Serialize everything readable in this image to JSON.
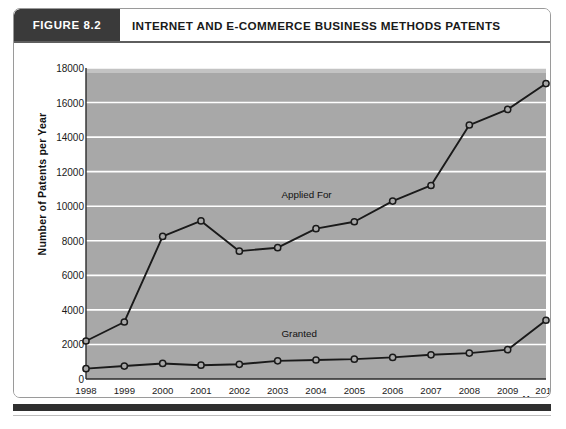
{
  "figure": {
    "badge": "FIGURE 8.2",
    "title": "INTERNET AND E-COMMERCE BUSINESS METHODS PATENTS"
  },
  "chart_data": {
    "type": "line",
    "title": "INTERNET AND E-COMMERCE BUSINESS METHODS PATENTS",
    "xlabel": "Year",
    "ylabel": "Number of Patents per Year",
    "categories": [
      "1998",
      "1999",
      "2000",
      "2001",
      "2002",
      "2003",
      "2004",
      "2005",
      "2006",
      "2007",
      "2008",
      "2009",
      "2010"
    ],
    "xlim": [
      1998,
      2010
    ],
    "ylim": [
      0,
      18000
    ],
    "yticks": [
      0,
      2000,
      4000,
      6000,
      8000,
      10000,
      12000,
      14000,
      16000,
      18000
    ],
    "grid": "horizontal",
    "legend": "inline-annotations",
    "series": [
      {
        "name": "Applied For",
        "values": [
          2200,
          3300,
          8250,
          9150,
          7400,
          7600,
          8700,
          9100,
          10300,
          11200,
          14700,
          15600,
          17100
        ],
        "label_x": 2003.1,
        "label_y": 10600,
        "marker": "open-circle",
        "color": "#1a1a1a"
      },
      {
        "name": "Granted",
        "values": [
          600,
          750,
          900,
          800,
          850,
          1050,
          1100,
          1150,
          1250,
          1400,
          1500,
          1700,
          3400
        ],
        "label_x": 2003.1,
        "label_y": 2550,
        "marker": "open-circle",
        "color": "#1a1a1a"
      }
    ],
    "plot_background": "#a8a8a8",
    "gridline_color": "#ffffff"
  }
}
